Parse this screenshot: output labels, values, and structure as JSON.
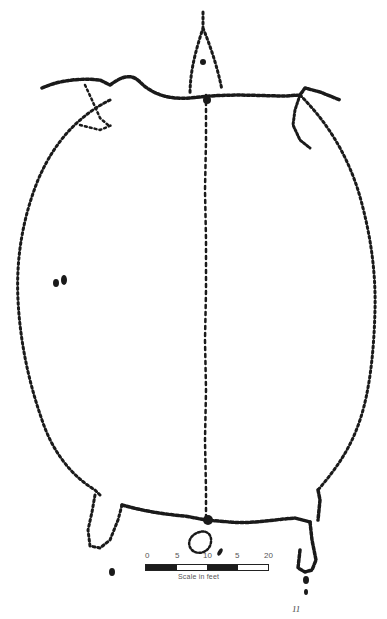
{
  "figure": {
    "type": "archaeological site plan (stone setting outline)",
    "figure_mark": "11",
    "colors": {
      "ink": "#1a1a1a",
      "paper": "#ffffff",
      "scale_text": "#555555"
    }
  },
  "scale": {
    "tick_labels": [
      "0",
      "5",
      "10",
      "5",
      "20"
    ],
    "caption": "Scale in feet",
    "segments": [
      "dark",
      "light",
      "dark",
      "light"
    ]
  }
}
